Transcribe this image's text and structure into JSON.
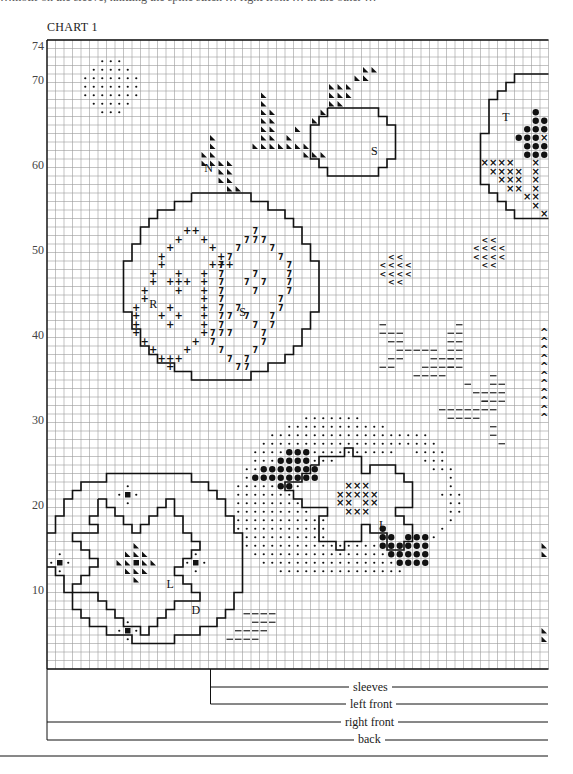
{
  "page": {
    "top_clipped_text": "…motif on the sleeve, knitting the spine stitch … right front … in the other …",
    "title": "CHART 1"
  },
  "chart_data": {
    "type": "knitting-chart",
    "title": "CHART 1",
    "rows": 74,
    "columns": 59,
    "y_tick_labels": [
      "74",
      "70",
      "60",
      "50",
      "40",
      "30",
      "20",
      "10"
    ],
    "y_tick_rows": [
      74,
      70,
      60,
      50,
      40,
      30,
      20,
      10
    ],
    "motif_letters": [
      {
        "text": "N",
        "col": 19,
        "row": 59
      },
      {
        "text": "R",
        "col": 12.5,
        "row": 43
      },
      {
        "text": "S",
        "col": 23,
        "row": 42
      },
      {
        "text": "S",
        "col": 38.5,
        "row": 61
      },
      {
        "text": "T",
        "col": 54,
        "row": 65
      },
      {
        "text": "L",
        "col": 39.5,
        "row": 17
      },
      {
        "text": "L",
        "col": 14.5,
        "row": 10
      },
      {
        "text": "D",
        "col": 17.5,
        "row": 7
      }
    ],
    "size_key": [
      {
        "label": "sleeves",
        "start_col": 19
      },
      {
        "label": "left front",
        "start_col": 19
      },
      {
        "label": "right front",
        "start_col": 0
      },
      {
        "label": "back",
        "start_col": 0
      }
    ],
    "symbols": {
      "dot": "small dot",
      "big_dot": "bobble",
      "triangle": "dark triangle",
      "cross": "x",
      "plus": "+",
      "seven": "slant left",
      "lt": "slant right",
      "dash": "dash",
      "chevron": "^",
      "square": "filled square"
    }
  },
  "labels": {
    "sleeves": "sleeves",
    "left_front": "left front",
    "right_front": "right front",
    "back": "back"
  }
}
